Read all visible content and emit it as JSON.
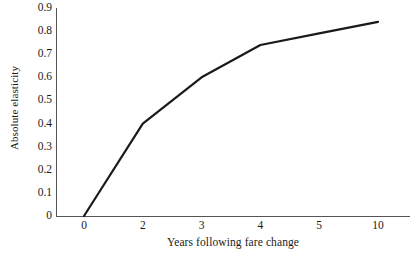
{
  "chart_data": {
    "type": "line",
    "title": "",
    "xlabel": "Years following fare change",
    "ylabel": "Absolute elasticity",
    "categories": [
      "0",
      "2",
      "3",
      "4",
      "5",
      "10"
    ],
    "values": [
      0,
      0.4,
      0.6,
      0.74,
      0.79,
      0.84
    ],
    "series": [
      {
        "name": "Absolute elasticity",
        "values": [
          0,
          0.4,
          0.6,
          0.74,
          0.79,
          0.84
        ],
        "color": "#1a1a1a"
      }
    ],
    "ylim": [
      0,
      0.9
    ],
    "yticks": [
      "0",
      "0.1",
      "0.2",
      "0.3",
      "0.4",
      "0.5",
      "0.6",
      "0.7",
      "0.8",
      "0.9"
    ],
    "ytick_values": [
      0,
      0.1,
      0.2,
      0.3,
      0.4,
      0.5,
      0.6,
      0.7,
      0.8,
      0.9
    ],
    "grid": false,
    "legend": "none",
    "axis_color": "#555555",
    "line_color": "#1a1a1a",
    "background": "#ffffff"
  }
}
